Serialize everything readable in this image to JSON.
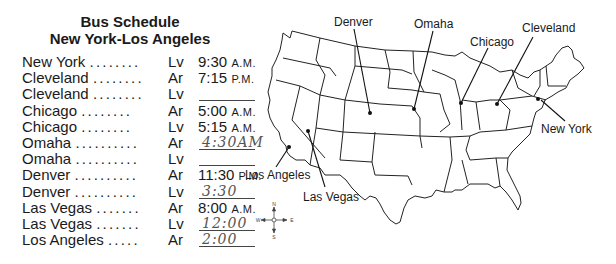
{
  "title": {
    "line1": "Bus Schedule",
    "line2": "New York-Los Angeles"
  },
  "schedule": [
    {
      "city": "New York",
      "dots": "........",
      "code": "Lv",
      "time": "9:30",
      "ampm": "A.M.",
      "handwritten": false
    },
    {
      "city": "Cleveland",
      "dots": "........",
      "code": "Ar",
      "time": "7:15",
      "ampm": "P.M.",
      "handwritten": false
    },
    {
      "city": "Cleveland",
      "dots": "........",
      "code": "Lv",
      "time": "",
      "ampm": "",
      "handwritten": false,
      "blank": true
    },
    {
      "city": "Chicago",
      "dots": "........",
      "code": "Ar",
      "time": "5:00",
      "ampm": "A.M.",
      "handwritten": false
    },
    {
      "city": "Chicago",
      "dots": "........",
      "code": "Lv",
      "time": "5:15",
      "ampm": "A.M.",
      "handwritten": false
    },
    {
      "city": "Omaha",
      "dots": "..........",
      "code": "Ar",
      "time": "4:30AM",
      "ampm": "",
      "handwritten": true
    },
    {
      "city": "Omaha",
      "dots": "..........",
      "code": "Lv",
      "time": "",
      "ampm": "",
      "handwritten": false,
      "blank": true
    },
    {
      "city": "Denver",
      "dots": "..........",
      "code": "Ar",
      "time": "11:30",
      "ampm": "P.M.",
      "handwritten": false
    },
    {
      "city": "Denver",
      "dots": "..........",
      "code": "Lv",
      "time": "3:30",
      "ampm": "",
      "handwritten": true
    },
    {
      "city": "Las Vegas",
      "dots": ".......",
      "code": "Ar",
      "time": "8:00",
      "ampm": "A.M.",
      "handwritten": false
    },
    {
      "city": "Las Vegas",
      "dots": ".......",
      "code": "Lv",
      "time": "12:00",
      "ampm": "",
      "handwritten": true
    },
    {
      "city": "Los Angeles",
      "dots": ".....",
      "code": "Ar",
      "time": "2:00",
      "ampm": "",
      "handwritten": true
    }
  ],
  "map": {
    "labels": {
      "denver": "Denver",
      "omaha": "Omaha",
      "chicago": "Chicago",
      "cleveland": "Cleveland",
      "new_york": "New York",
      "los_angeles": "Los Angeles",
      "las_vegas": "Las Vegas"
    },
    "compass": {
      "n": "N",
      "s": "S",
      "e": "E",
      "w": "W"
    }
  }
}
